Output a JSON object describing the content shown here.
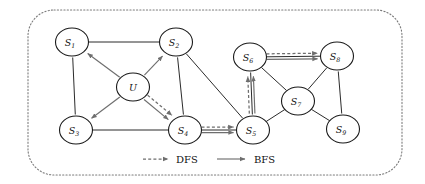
{
  "figure": {
    "frame": {
      "style": "dotted-rounded-rectangle",
      "color": "#7a7a7a"
    }
  },
  "colors": {
    "node_stroke": "#1a1a1a",
    "node_fill": "#ffffff",
    "edge": "#2b2b2b",
    "traversal_arrow": "#6e6e6e",
    "frame": "#7a7a7a",
    "text": "#111111"
  },
  "graph": {
    "nodes": [
      {
        "id": "S1",
        "base": "S",
        "sub": "1",
        "cx": 72,
        "cy": 42
      },
      {
        "id": "S2",
        "base": "S",
        "sub": "2",
        "cx": 176,
        "cy": 42
      },
      {
        "id": "U",
        "base": "U",
        "sub": "",
        "cx": 133,
        "cy": 87
      },
      {
        "id": "S3",
        "base": "S",
        "sub": "3",
        "cx": 76,
        "cy": 130
      },
      {
        "id": "S4",
        "base": "S",
        "sub": "4",
        "cx": 185,
        "cy": 130
      },
      {
        "id": "S5",
        "base": "S",
        "sub": "5",
        "cx": 253,
        "cy": 130
      },
      {
        "id": "S6",
        "base": "S",
        "sub": "6",
        "cx": 250,
        "cy": 57
      },
      {
        "id": "S7",
        "base": "S",
        "sub": "7",
        "cx": 298,
        "cy": 101
      },
      {
        "id": "S8",
        "base": "S",
        "sub": "8",
        "cx": 337,
        "cy": 56
      },
      {
        "id": "S9",
        "base": "S",
        "sub": "9",
        "cx": 343,
        "cy": 129
      }
    ],
    "edges": [
      {
        "from": "S1",
        "to": "S2"
      },
      {
        "from": "S1",
        "to": "S3"
      },
      {
        "from": "S2",
        "to": "S4"
      },
      {
        "from": "S2",
        "to": "S5"
      },
      {
        "from": "S3",
        "to": "S4"
      },
      {
        "from": "S4",
        "to": "S5"
      },
      {
        "from": "S5",
        "to": "S6"
      },
      {
        "from": "S5",
        "to": "S7"
      },
      {
        "from": "S6",
        "to": "S7"
      },
      {
        "from": "S6",
        "to": "S8"
      },
      {
        "from": "S7",
        "to": "S8"
      },
      {
        "from": "S7",
        "to": "S9"
      },
      {
        "from": "S8",
        "to": "S9"
      }
    ],
    "bfs_arrows": [
      {
        "from": "U",
        "to": "S1"
      },
      {
        "from": "U",
        "to": "S2"
      },
      {
        "from": "U",
        "to": "S3"
      },
      {
        "from": "U",
        "to": "S4"
      },
      {
        "from": "S4",
        "to": "S5"
      },
      {
        "from": "S5",
        "to": "S6"
      },
      {
        "from": "S6",
        "to": "S8"
      }
    ],
    "dfs_arrows": [
      {
        "from": "U",
        "to": "S4"
      },
      {
        "from": "S4",
        "to": "S5"
      },
      {
        "from": "S5",
        "to": "S6"
      },
      {
        "from": "S6",
        "to": "S8"
      }
    ]
  },
  "legend": {
    "items": [
      {
        "key": "dfs",
        "label": "DFS",
        "line_style": "dashed",
        "arrow": true
      },
      {
        "key": "bfs",
        "label": "BFS",
        "line_style": "solid",
        "arrow": true
      }
    ]
  }
}
